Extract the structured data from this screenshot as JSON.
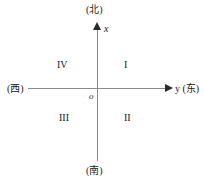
{
  "figure": {
    "directions": {
      "north": "(北)",
      "south": "(南)",
      "west": "(西)",
      "east": "y (东)"
    },
    "axes": {
      "vertical_label": "x",
      "origin_label": "o"
    },
    "quadrants": [
      {
        "id": "q1",
        "label": "I"
      },
      {
        "id": "q2",
        "label": "II"
      },
      {
        "id": "q3",
        "label": "III"
      },
      {
        "id": "q4",
        "label": "IV"
      }
    ]
  },
  "chart_data": {
    "type": "scatter",
    "title": "",
    "xlabel": "y (东)",
    "ylabel": "x (北)",
    "grid": false,
    "legend": "none",
    "xlim": [
      -1,
      1
    ],
    "ylim": [
      -1,
      1
    ],
    "series": [],
    "annotations": [
      {
        "text": "(北)",
        "x": 0,
        "y": 1.0,
        "role": "direction-north"
      },
      {
        "text": "(南)",
        "x": 0,
        "y": -1.0,
        "role": "direction-south"
      },
      {
        "text": "(西)",
        "x": -1.0,
        "y": 0,
        "role": "direction-west"
      },
      {
        "text": "y (东)",
        "x": 1.0,
        "y": 0,
        "role": "direction-east"
      },
      {
        "text": "x",
        "x": 0.06,
        "y": 0.92,
        "role": "axis-name-vertical"
      },
      {
        "text": "o",
        "x": -0.06,
        "y": -0.05,
        "role": "origin"
      },
      {
        "text": "I",
        "x": 0.35,
        "y": 0.4,
        "role": "quadrant"
      },
      {
        "text": "II",
        "x": 0.35,
        "y": -0.35,
        "role": "quadrant"
      },
      {
        "text": "III",
        "x": -0.35,
        "y": -0.35,
        "role": "quadrant"
      },
      {
        "text": "IV",
        "x": -0.35,
        "y": 0.4,
        "role": "quadrant"
      }
    ]
  }
}
